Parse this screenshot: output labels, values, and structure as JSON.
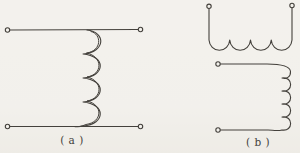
{
  "colors": {
    "paper": "#f3f1ec",
    "ink": "#44413c"
  },
  "figures": [
    {
      "id": "a",
      "label": "( a )"
    },
    {
      "id": "b",
      "label": "( b )"
    }
  ]
}
